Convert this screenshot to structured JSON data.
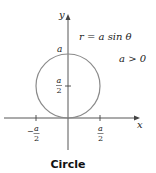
{
  "diagram": {
    "equation": "r = a sin θ",
    "condition": "a > 0",
    "caption": "Circle",
    "axes": {
      "x_label": "x",
      "y_label": "y"
    },
    "labels": {
      "top": "a",
      "center_num": "a",
      "center_den": "2",
      "neg_half_sign": "−",
      "neg_half_num": "a",
      "neg_half_den": "2",
      "pos_half_num": "a",
      "pos_half_den": "2"
    },
    "colors": {
      "curve": "#8a8a8a",
      "axes": "#333333"
    }
  }
}
